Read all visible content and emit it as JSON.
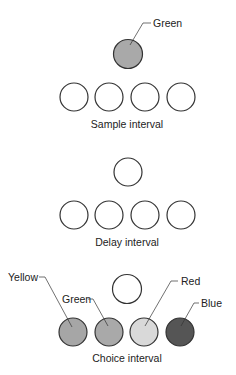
{
  "colors": {
    "stroke": "#333333",
    "empty": "#ffffff",
    "green": "#a9a9a9",
    "yellow": "#a6a6a6",
    "red": "#d9d9d9",
    "blue": "#555555"
  },
  "panels": [
    {
      "name": "sample",
      "caption": "Sample interval",
      "center_label": "Green"
    },
    {
      "name": "delay",
      "caption": "Delay interval"
    },
    {
      "name": "choice",
      "caption": "Choice interval",
      "labels": [
        "Yellow",
        "Green",
        "Red",
        "Blue"
      ]
    }
  ]
}
